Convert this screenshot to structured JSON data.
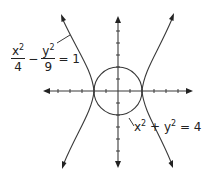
{
  "diagram": {
    "colors": {
      "stroke": "#3a3a3a",
      "text": "#222222",
      "background": "#ffffff"
    },
    "axes": {
      "origin_px": [
        118,
        91
      ],
      "unit_px": 12,
      "x_range_units": [
        -6,
        6
      ],
      "y_range_units": [
        -6,
        6
      ],
      "tick_marks": true,
      "arrows": [
        "left",
        "right",
        "up",
        "down"
      ]
    },
    "hyperbola": {
      "equation": "x^2/4 - y^2/9 = 1",
      "label": {
        "x_num": "x",
        "x_exp": "2",
        "x_den": "4",
        "minus": "−",
        "y_num": "y",
        "y_exp": "2",
        "y_den": "9",
        "equals": "= 1"
      }
    },
    "circle": {
      "equation": "x^2 + y^2 = 4",
      "radius_units": 2,
      "label": {
        "x": "x",
        "x_exp": "2",
        "plus": " + ",
        "y": "y",
        "y_exp": "2",
        "rhs": " = 4"
      }
    }
  }
}
